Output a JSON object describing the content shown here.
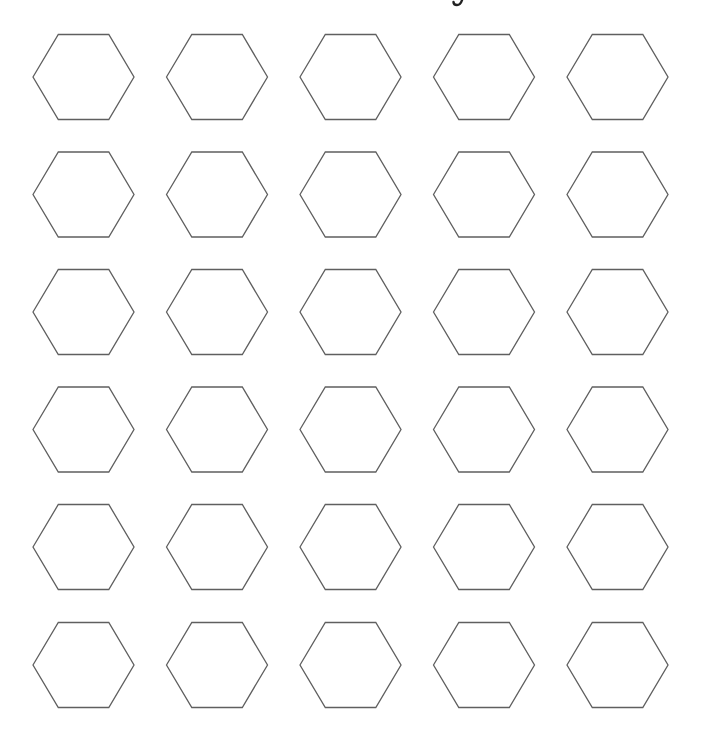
{
  "page": {
    "width": 704,
    "height": 747,
    "background": "#ffffff"
  },
  "cropped_title_fragment": {
    "visible": true,
    "description": "descender of a letter cut off at top edge"
  },
  "grid": {
    "rows": 6,
    "columns": 5,
    "shape": "hexagon",
    "orientation": "flat-top",
    "fill": "#ffffff",
    "stroke": "#5f5f5f",
    "stroke_width": 1.3,
    "hex_width": 101,
    "hex_height": 85,
    "column_centers_x": [
      83.5,
      217,
      350.5,
      484,
      617.5
    ],
    "row_centers_y": [
      77,
      194.5,
      312,
      429.5,
      547,
      665
    ]
  }
}
